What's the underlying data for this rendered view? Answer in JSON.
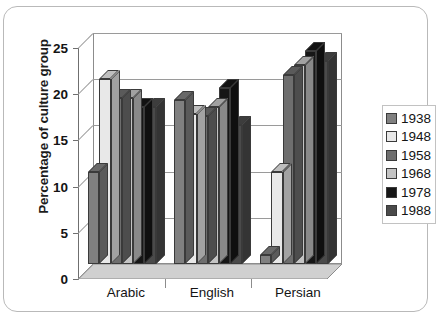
{
  "chart_data": {
    "type": "bar",
    "title": "",
    "subtitle": "",
    "xlabel": "",
    "ylabel": "Percentage of culture group",
    "categories": [
      "Arabic",
      "English",
      "Persian"
    ],
    "ylim": [
      0,
      25
    ],
    "yticks": [
      0,
      5,
      10,
      15,
      20,
      25
    ],
    "ytick_labels": [
      "0",
      "5",
      "10",
      "15",
      "20",
      "25"
    ],
    "grid": true,
    "legend_position": "right",
    "style": "3d-clustered-column",
    "series": [
      {
        "name": "1938",
        "color": "#808080",
        "values": [
          10,
          17.8,
          1
        ]
      },
      {
        "name": "1948",
        "color": "#e8e8e8",
        "values": [
          20,
          16.2,
          10
        ]
      },
      {
        "name": "1958",
        "color": "#6e6e6e",
        "values": [
          18,
          16,
          20.5
        ]
      },
      {
        "name": "1968",
        "color": "#c4c4c4",
        "values": [
          18,
          17,
          21.5
        ]
      },
      {
        "name": "1978",
        "color": "#161616",
        "values": [
          17,
          19,
          23
        ]
      },
      {
        "name": "1988",
        "color": "#4a4a4a",
        "values": [
          17,
          15,
          22
        ]
      }
    ]
  },
  "legend": {
    "items": [
      {
        "label": "1938",
        "color": "#808080"
      },
      {
        "label": "1948",
        "color": "#e8e8e8"
      },
      {
        "label": "1958",
        "color": "#6e6e6e"
      },
      {
        "label": "1968",
        "color": "#c4c4c4"
      },
      {
        "label": "1978",
        "color": "#161616"
      },
      {
        "label": "1988",
        "color": "#4a4a4a"
      }
    ]
  },
  "colors": {
    "background": "#ffffff",
    "frame_border": "#b9b9b9",
    "gridline": "#9a9a9a",
    "axis": "#6f6f6f",
    "text": "#141414",
    "bar_outline": "#3a3a3a",
    "floor": "#d0d0d0"
  }
}
